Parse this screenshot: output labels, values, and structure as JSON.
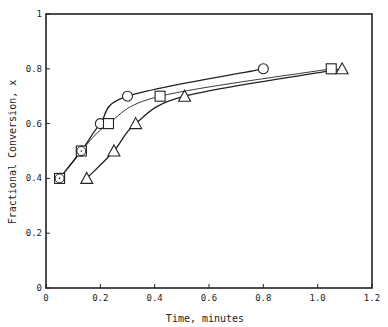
{
  "chart_data": {
    "type": "scatter",
    "title": "",
    "xlabel": "Time, minutes",
    "ylabel": "Fractional Conversion, x",
    "xlim": [
      0,
      1.2
    ],
    "ylim": [
      0,
      1
    ],
    "xticks": [
      "0",
      "0.2",
      "0.4",
      "0.6",
      "0.8",
      "1.0",
      "1.2"
    ],
    "yticks": [
      "0",
      "0.2",
      "0.4",
      "0.6",
      "0.8",
      "1"
    ],
    "grid": false,
    "legend": "none",
    "series": [
      {
        "name": "circle",
        "marker": "circle",
        "x": [
          0.05,
          0.13,
          0.2,
          0.3,
          0.8
        ],
        "y": [
          0.4,
          0.5,
          0.6,
          0.7,
          0.8
        ]
      },
      {
        "name": "square",
        "marker": "square",
        "x": [
          0.05,
          0.13,
          0.23,
          0.42,
          1.05
        ],
        "y": [
          0.4,
          0.5,
          0.6,
          0.7,
          0.8
        ]
      },
      {
        "name": "triangle",
        "marker": "triangle",
        "x": [
          0.15,
          0.25,
          0.33,
          0.51,
          1.09
        ],
        "y": [
          0.4,
          0.5,
          0.6,
          0.7,
          0.8
        ]
      }
    ]
  },
  "colors": {
    "ink": "#222222",
    "background": "#ffffff"
  }
}
